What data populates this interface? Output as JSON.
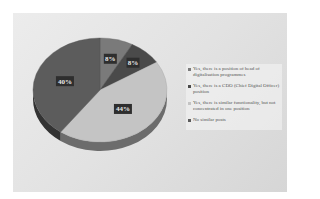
{
  "chart_data": {
    "type": "pie",
    "title": "",
    "three_d": true,
    "start_angle_deg": 0,
    "direction": "clockwise",
    "legend_position": "right",
    "slices": [
      {
        "label": "Yes, there is a position of head of digitalisation programmes",
        "value": 8,
        "display": "8%",
        "color": "#7a7a7a"
      },
      {
        "label": "Yes, there is a CDO (Chief Digital Officer) position",
        "value": 8,
        "display": "8%",
        "color": "#4a4a4a"
      },
      {
        "label": "Yes, there is similar functionality, but not concentrated in one position",
        "value": 44,
        "display": "44%",
        "color": "#c4c4c4"
      },
      {
        "label": "No similar posts",
        "value": 40,
        "display": "40%",
        "color": "#5c5c5c"
      }
    ]
  }
}
